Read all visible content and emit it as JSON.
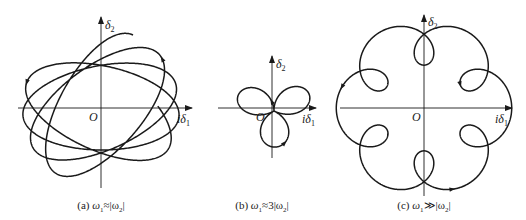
{
  "figure": {
    "stroke_color": "#1a1a1a",
    "axis_color": "#1a1a1a",
    "background": "#ffffff",
    "panels": [
      {
        "id": "a",
        "origin_label": "O",
        "x_axis_label": "iδ",
        "x_axis_sub": "1",
        "y_axis_label": "δ",
        "y_axis_sub": "2",
        "caption_prefix": "(a) ",
        "caption_omega1": "ω",
        "caption_sub1": "1",
        "caption_rel": "≈",
        "caption_rhs": "|ω",
        "caption_sub2": "2",
        "caption_end": "|",
        "description": "precessing ellipse trajectory"
      },
      {
        "id": "b",
        "origin_label": "O",
        "x_axis_label": "iδ",
        "x_axis_sub": "1",
        "y_axis_label": "δ",
        "y_axis_sub": "2",
        "caption_prefix": "(b) ",
        "caption_omega1": "ω",
        "caption_sub1": "1",
        "caption_rel": "≈",
        "caption_rhs": "3|ω",
        "caption_sub2": "2",
        "caption_end": "|",
        "description": "three-lobed trajectory"
      },
      {
        "id": "c",
        "origin_label": "O",
        "x_axis_label": "iδ",
        "x_axis_sub": "1",
        "y_axis_label": "δ",
        "y_axis_sub": "2",
        "caption_prefix": "(c) ",
        "caption_omega1": "ω",
        "caption_sub1": "1",
        "caption_rel": "≫",
        "caption_rhs": "|ω",
        "caption_sub2": "2",
        "caption_end": "|",
        "description": "looping epicyclic trajectory"
      }
    ]
  }
}
